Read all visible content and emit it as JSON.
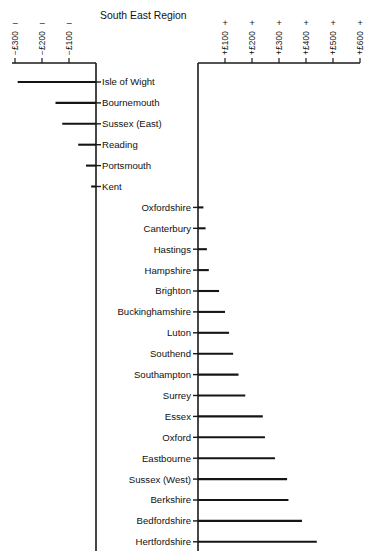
{
  "chart_data": {
    "type": "bar",
    "orientation": "horizontal",
    "title": "South East Region",
    "xlabel": "",
    "ylabel": "",
    "grid": false,
    "legend": null,
    "axes": [
      {
        "name": "negative-axis",
        "position": "top-left",
        "ticks": [
          -300,
          -200,
          -100
        ],
        "tick_labels": [
          "−£300",
          "−£200",
          "−£100"
        ],
        "sign": "−",
        "range": [
          -340,
          0
        ]
      },
      {
        "name": "positive-axis",
        "position": "top-right",
        "ticks": [
          100,
          200,
          300,
          400,
          500,
          600
        ],
        "tick_labels": [
          "+£100",
          "+£200",
          "+£300",
          "+£400",
          "+£500",
          "+£600"
        ],
        "sign": "+",
        "range": [
          0,
          600
        ]
      }
    ],
    "categories": [
      "Isle of Wight",
      "Bournemouth",
      "Sussex (East)",
      "Reading",
      "Portsmouth",
      "Kent",
      "Oxfordshire",
      "Canterbury",
      "Hastings",
      "Hampshire",
      "Brighton",
      "Buckinghamshire",
      "Luton",
      "Southend",
      "Southampton",
      "Surrey",
      "Essex",
      "Oxford",
      "Eastbourne",
      "Sussex (West)",
      "Berkshire",
      "Bedfordshire",
      "Hertfordshire"
    ],
    "values": [
      -290,
      -150,
      -125,
      -66,
      -37,
      -18,
      20,
      28,
      33,
      40,
      78,
      100,
      115,
      130,
      150,
      175,
      240,
      248,
      285,
      330,
      335,
      385,
      440
    ],
    "units": "£"
  },
  "title": "South East Region"
}
